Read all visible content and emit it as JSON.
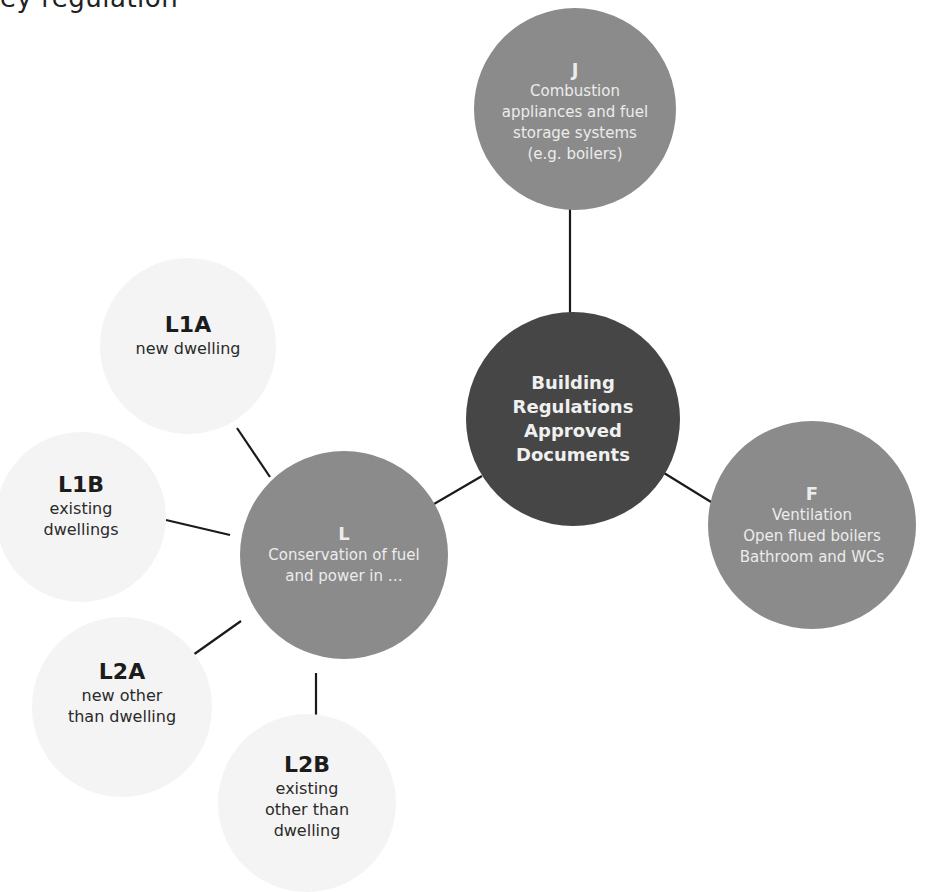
{
  "fragment": {
    "top_text": "ey regulation"
  },
  "diagram": {
    "hub": {
      "title_lines": [
        "Building",
        "Regulations",
        "Approved",
        "Documents"
      ]
    },
    "primary": [
      {
        "id": "J",
        "code": "J",
        "desc_lines": [
          "Combustion",
          "appliances and fuel",
          "storage systems",
          "(e.g. boilers)"
        ]
      },
      {
        "id": "F",
        "code": "F",
        "desc_lines": [
          "Ventilation",
          "Open flued boilers",
          "Bathroom and WCs"
        ]
      },
      {
        "id": "L",
        "code": "L",
        "desc_lines": [
          "Conservation of fuel",
          "and power in …"
        ]
      }
    ],
    "secondary": [
      {
        "id": "L1A",
        "code": "L1A",
        "desc_lines": [
          "new dwelling"
        ]
      },
      {
        "id": "L1B",
        "code": "L1B",
        "desc_lines": [
          "existing",
          "dwellings"
        ]
      },
      {
        "id": "L2A",
        "code": "L2A",
        "desc_lines": [
          "new other",
          "than dwelling"
        ]
      },
      {
        "id": "L2B",
        "code": "L2B",
        "desc_lines": [
          "existing",
          "other than",
          "dwelling"
        ]
      }
    ],
    "edges": [
      [
        "hub",
        "J"
      ],
      [
        "hub",
        "F"
      ],
      [
        "hub",
        "L"
      ],
      [
        "L",
        "L1A"
      ],
      [
        "L",
        "L1B"
      ],
      [
        "L",
        "L2A"
      ],
      [
        "L",
        "L2B"
      ]
    ],
    "colors": {
      "hub": "#464646",
      "primary": "#8b8b8b",
      "secondary": "#f4f4f4",
      "line": "#1a1a1a",
      "hub_text": "#f0f0f0",
      "primary_text": "#ececec",
      "secondary_text": "#1c1c1c"
    }
  }
}
